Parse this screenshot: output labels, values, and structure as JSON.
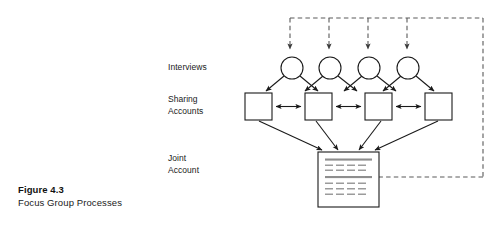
{
  "figure": {
    "caption_title": "Figure 4.3",
    "caption_subtitle": "Focus Group Processes",
    "background_color": "#ffffff",
    "stroke_color": "#1a1a1a",
    "dashed_color": "#5a5a5a",
    "document_line_color": "#999999"
  },
  "rows": {
    "interviews": {
      "label": "Interviews",
      "node_count": 4,
      "shape": "circle"
    },
    "sharing_accounts": {
      "label": "Sharing\nAccounts",
      "node_count": 4,
      "shape": "square"
    },
    "joint_account": {
      "label": "Joint\nAccount",
      "node_count": 1,
      "shape": "document"
    }
  },
  "connections": {
    "feedback_loop_label": "dashed-feedback-loop",
    "interview_to_sharing": "arrow-down-right",
    "sharing_peer_links": "double-headed-arrow",
    "sharing_to_joint": "arrow-converging",
    "joint_to_feedback": "dashed-return-path"
  },
  "icons": {
    "circle_node": "circle-node-icon",
    "square_node": "square-node-icon",
    "document_node": "document-node-icon",
    "arrow_head": "arrow-head-icon",
    "double_arrow": "double-arrow-icon"
  }
}
